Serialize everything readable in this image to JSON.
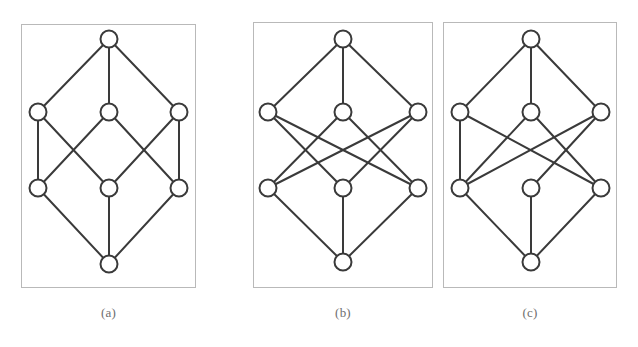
{
  "figure": {
    "type": "graph-diagram-set",
    "background_color": "#ffffff",
    "node_stroke_color": "#3a3a3a",
    "node_fill_color": "#ffffff",
    "edge_color": "#3a3a3a",
    "frame_color": "#b9b9b9",
    "caption_color": "#6e6e6e",
    "node_radius": 8.5,
    "edge_width": 2,
    "panels": [
      {
        "id": "panel-a",
        "caption": "(a)",
        "frame": {
          "x": 21,
          "y": 24,
          "width": 175,
          "height": 264
        },
        "caption_x": 21,
        "caption_y": 305,
        "caption_width": 175,
        "node_count": 8,
        "edge_count": 12,
        "nodes": [
          {
            "id": "top",
            "label": "top",
            "x": 88,
            "y": 15
          },
          {
            "id": "u-left",
            "label": "upper-left",
            "x": 17,
            "y": 88
          },
          {
            "id": "u-mid",
            "label": "upper-middle",
            "x": 88,
            "y": 88
          },
          {
            "id": "u-right",
            "label": "upper-right",
            "x": 158,
            "y": 88
          },
          {
            "id": "l-left",
            "label": "lower-left",
            "x": 17,
            "y": 164
          },
          {
            "id": "l-mid",
            "label": "lower-middle",
            "x": 88,
            "y": 164
          },
          {
            "id": "l-right",
            "label": "lower-right",
            "x": 158,
            "y": 164
          },
          {
            "id": "bottom",
            "label": "bottom",
            "x": 88,
            "y": 240
          }
        ],
        "edges": [
          [
            "top",
            "u-left"
          ],
          [
            "top",
            "u-mid"
          ],
          [
            "top",
            "u-right"
          ],
          [
            "u-left",
            "l-left"
          ],
          [
            "u-left",
            "l-mid"
          ],
          [
            "u-mid",
            "l-left"
          ],
          [
            "u-mid",
            "l-right"
          ],
          [
            "u-right",
            "l-mid"
          ],
          [
            "u-right",
            "l-right"
          ],
          [
            "l-left",
            "bottom"
          ],
          [
            "l-mid",
            "bottom"
          ],
          [
            "l-right",
            "bottom"
          ]
        ]
      },
      {
        "id": "panel-b",
        "caption": "(b)",
        "frame": {
          "x": 253,
          "y": 22,
          "width": 180,
          "height": 266
        },
        "caption_x": 253,
        "caption_y": 305,
        "caption_width": 180,
        "node_count": 8,
        "edge_count": 12,
        "nodes": [
          {
            "id": "top",
            "label": "top",
            "x": 90,
            "y": 17
          },
          {
            "id": "u-left",
            "label": "upper-left",
            "x": 15,
            "y": 90
          },
          {
            "id": "u-mid",
            "label": "upper-middle",
            "x": 90,
            "y": 90
          },
          {
            "id": "u-right",
            "label": "upper-right",
            "x": 165,
            "y": 90
          },
          {
            "id": "l-left",
            "label": "lower-left",
            "x": 15,
            "y": 166
          },
          {
            "id": "l-mid",
            "label": "lower-middle",
            "x": 90,
            "y": 166
          },
          {
            "id": "l-right",
            "label": "lower-right",
            "x": 165,
            "y": 166
          },
          {
            "id": "bottom",
            "label": "bottom",
            "x": 90,
            "y": 240
          }
        ],
        "edges": [
          [
            "top",
            "u-left"
          ],
          [
            "top",
            "u-mid"
          ],
          [
            "top",
            "u-right"
          ],
          [
            "u-left",
            "l-mid"
          ],
          [
            "u-left",
            "l-right"
          ],
          [
            "u-mid",
            "l-left"
          ],
          [
            "u-mid",
            "l-right"
          ],
          [
            "u-right",
            "l-left"
          ],
          [
            "u-right",
            "l-mid"
          ],
          [
            "l-left",
            "bottom"
          ],
          [
            "l-mid",
            "bottom"
          ],
          [
            "l-right",
            "bottom"
          ]
        ]
      },
      {
        "id": "panel-c",
        "caption": "(c)",
        "frame": {
          "x": 443,
          "y": 22,
          "width": 174,
          "height": 266
        },
        "caption_x": 443,
        "caption_y": 305,
        "caption_width": 174,
        "node_count": 8,
        "edge_count": 12,
        "nodes": [
          {
            "id": "top",
            "label": "top",
            "x": 88,
            "y": 17
          },
          {
            "id": "u-left",
            "label": "upper-left",
            "x": 17,
            "y": 90
          },
          {
            "id": "u-mid",
            "label": "upper-middle",
            "x": 88,
            "y": 90
          },
          {
            "id": "u-right",
            "label": "upper-right",
            "x": 158,
            "y": 90
          },
          {
            "id": "l-left",
            "label": "lower-left",
            "x": 17,
            "y": 166
          },
          {
            "id": "l-mid",
            "label": "lower-middle",
            "x": 88,
            "y": 166
          },
          {
            "id": "l-right",
            "label": "lower-right",
            "x": 158,
            "y": 166
          },
          {
            "id": "bottom",
            "label": "bottom",
            "x": 88,
            "y": 240
          }
        ],
        "edges": [
          [
            "top",
            "u-left"
          ],
          [
            "top",
            "u-mid"
          ],
          [
            "top",
            "u-right"
          ],
          [
            "u-left",
            "l-left"
          ],
          [
            "u-left",
            "l-right"
          ],
          [
            "u-mid",
            "l-left"
          ],
          [
            "u-mid",
            "l-right"
          ],
          [
            "u-right",
            "l-left"
          ],
          [
            "u-right",
            "l-mid"
          ],
          [
            "l-left",
            "bottom"
          ],
          [
            "l-mid",
            "bottom"
          ],
          [
            "l-right",
            "bottom"
          ]
        ]
      }
    ]
  }
}
